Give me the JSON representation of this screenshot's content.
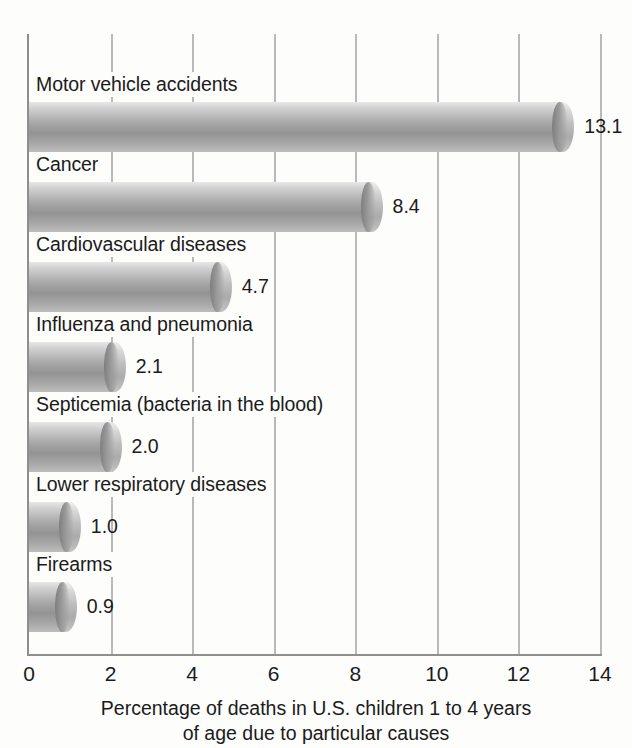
{
  "chart_data": {
    "type": "bar",
    "orientation": "horizontal",
    "title": "",
    "xlabel": "Percentage of deaths in U.S. children 1 to 4 years of age due to particular causes",
    "xlabel_line1": "Percentage of deaths in U.S. children 1 to 4 years",
    "xlabel_line2": "of age due to particular causes",
    "ylabel": "",
    "categories": [
      "Motor vehicle accidents",
      "Cancer",
      "Cardiovascular diseases",
      "Influenza and pneumonia",
      "Septicemia (bacteria in the blood)",
      "Lower respiratory diseases",
      "Firearms"
    ],
    "values": [
      13.1,
      8.4,
      4.7,
      2.1,
      2.0,
      1.0,
      0.9
    ],
    "value_labels": [
      "13.1",
      "8.4",
      "4.7",
      "2.1",
      "2.0",
      "1.0",
      "0.9"
    ],
    "xlim": [
      0,
      14
    ],
    "xticks": [
      0,
      2,
      4,
      6,
      8,
      10,
      12,
      14
    ],
    "xtick_labels": [
      "0",
      "2",
      "4",
      "6",
      "8",
      "10",
      "12",
      "14"
    ],
    "grid": true,
    "grid_axis": "x",
    "legend": false,
    "bar_style": "cylinder",
    "colors": {
      "background": "#fdfdfc",
      "bar_light": "#e7e7e7",
      "bar_mid": "#939393",
      "bar_dark": "#7e7e7e",
      "gridline": "#b9b9b9",
      "axis": "#8f8f8f",
      "text": "#1b1b1b"
    }
  }
}
